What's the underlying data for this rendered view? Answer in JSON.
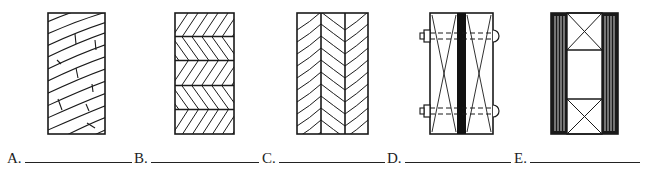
{
  "figures": [
    {
      "id": "A",
      "label": "A.",
      "description": "Plain-sawn lumber end grain with curved growth rings and checks"
    },
    {
      "id": "B",
      "label": "B.",
      "description": "Laminated block with alternating herringbone horizontal layers"
    },
    {
      "id": "C",
      "label": "C.",
      "description": "Three vertical laminations with chevron grain pattern"
    },
    {
      "id": "D",
      "label": "D.",
      "description": "Built-up member with two X-braced pieces, dark center plate and through-bolts"
    },
    {
      "id": "E",
      "label": "E.",
      "description": "Box member with vertical-lined side plates and X-blocked ends"
    }
  ],
  "answers": [
    {
      "letter": "A.",
      "value": ""
    },
    {
      "letter": "B.",
      "value": ""
    },
    {
      "letter": "C.",
      "value": ""
    },
    {
      "letter": "D.",
      "value": ""
    },
    {
      "letter": "E.",
      "value": ""
    }
  ],
  "colors": {
    "ink": "#1a1a1a",
    "paper": "#ffffff"
  }
}
